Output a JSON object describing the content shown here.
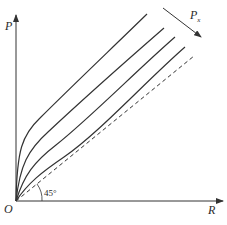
{
  "diagram": {
    "axes": {
      "y_label": "P",
      "x_label": "R",
      "origin_label": "O"
    },
    "arrow_label": {
      "main": "P",
      "sub": "x"
    },
    "angle_label": "45°",
    "reference_line": {
      "style": "dashed",
      "angle_deg": 45
    },
    "curves": [
      {
        "name": "curve-1"
      },
      {
        "name": "curve-2"
      },
      {
        "name": "curve-3"
      },
      {
        "name": "curve-4"
      }
    ],
    "colors": {
      "stroke": "#333333",
      "background": "#ffffff"
    }
  }
}
